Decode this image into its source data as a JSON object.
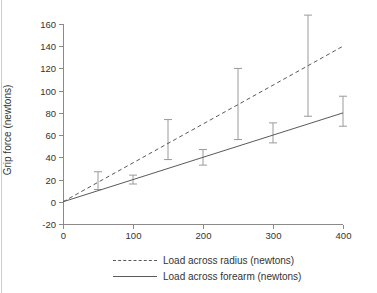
{
  "page": {
    "background": "#ffffff",
    "edge_line_color": "#cccccc",
    "axis_color": "#8a8a8a",
    "text_color": "#333333"
  },
  "chart_data": {
    "type": "line",
    "title": "",
    "xlabel": "",
    "ylabel": "Grip force (newtons)",
    "xlim": [
      0,
      400
    ],
    "ylim": [
      -20,
      160
    ],
    "x_ticks": [
      "0",
      "100",
      "200",
      "300",
      "400"
    ],
    "y_ticks": [
      "-20",
      "0",
      "20",
      "40",
      "60",
      "80",
      "100",
      "120",
      "140",
      "160"
    ],
    "grid": false,
    "legend_position": "bottom-center",
    "series": [
      {
        "name": "Load across radius (newtons)",
        "style": "dashed",
        "color": "#595959",
        "error_color": "#9a9a9a",
        "points": [
          {
            "x": 0,
            "y": 0
          },
          {
            "x": 50,
            "y": 17.5,
            "err_lo": 11,
            "err_hi": 27
          },
          {
            "x": 150,
            "y": 52.5,
            "err_lo": 38,
            "err_hi": 74
          },
          {
            "x": 250,
            "y": 87.5,
            "err_lo": 56,
            "err_hi": 120
          },
          {
            "x": 350,
            "y": 122.5,
            "err_lo": 77,
            "err_hi": 168
          },
          {
            "x": 400,
            "y": 140
          }
        ]
      },
      {
        "name": "Load across forearm (newtons)",
        "style": "solid",
        "color": "#595959",
        "error_color": "#9a9a9a",
        "points": [
          {
            "x": 0,
            "y": 0
          },
          {
            "x": 100,
            "y": 20,
            "err_lo": 16,
            "err_hi": 24
          },
          {
            "x": 200,
            "y": 40,
            "err_lo": 33,
            "err_hi": 47
          },
          {
            "x": 300,
            "y": 60,
            "err_lo": 53,
            "err_hi": 71
          },
          {
            "x": 400,
            "y": 80,
            "err_lo": 68,
            "err_hi": 95
          }
        ]
      }
    ]
  }
}
